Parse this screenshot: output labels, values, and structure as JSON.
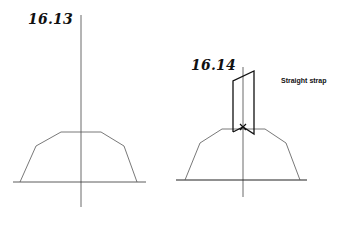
{
  "figures": [
    {
      "id": "16.13",
      "label": "16.13",
      "axis": {
        "x": 81,
        "y1": 15,
        "y2": 207
      },
      "baseline": {
        "y": 182,
        "x1": 13,
        "x2": 146
      },
      "pattern_outline": [
        [
          20,
          182
        ],
        [
          36,
          146
        ],
        [
          61,
          132
        ],
        [
          101,
          132
        ],
        [
          124,
          146
        ],
        [
          137,
          182
        ]
      ]
    },
    {
      "id": "16.14",
      "label": "16.14",
      "annotation": "Straight strap",
      "axis": {
        "x": 243,
        "y1": 67,
        "y2": 197
      },
      "baseline": {
        "y": 180,
        "x1": 176,
        "x2": 307
      },
      "pattern_outline": [
        [
          185,
          180
        ],
        [
          200,
          143
        ],
        [
          222,
          129
        ],
        [
          265,
          129
        ],
        [
          286,
          143
        ],
        [
          300,
          180
        ]
      ],
      "strap_outline": [
        [
          233,
          132
        ],
        [
          233,
          81
        ],
        [
          254,
          71
        ],
        [
          254,
          134
        ],
        [
          243,
          127
        ],
        [
          233,
          132
        ]
      ]
    }
  ],
  "colors": {
    "line": "#333333",
    "strap": "#111111",
    "background": "#ffffff"
  }
}
